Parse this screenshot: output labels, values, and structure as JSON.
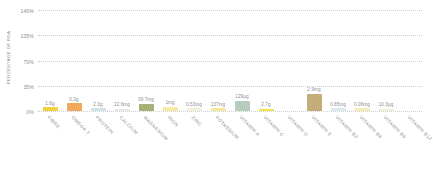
{
  "chart_data": {
    "type": "bar",
    "title": "",
    "xlabel": "",
    "ylabel": "PERCENTAGE OF RDA",
    "ylim": [
      0,
      140
    ],
    "grid": true,
    "legend": "none",
    "ytick_labels": [
      "140%",
      "105%",
      "70%",
      "35%",
      "0%"
    ],
    "ytick_values": [
      140,
      105,
      70,
      35,
      0
    ],
    "categories": [
      "FIBRE",
      "OMEGA 3",
      "PROTEIN",
      "CALCIUM",
      "MAGNESIUM",
      "IRON",
      "ZINC",
      "POTASSIUM",
      "VITAMIN A",
      "VITAMIN C",
      "VITAMIN D",
      "VITAMIN E",
      "VITAMIN B3",
      "VITAMIN B6",
      "VITAMIN B9",
      "VITAMIN B12"
    ],
    "values": [
      5,
      11,
      4,
      3,
      10,
      6,
      4,
      4,
      14,
      3,
      0,
      24,
      4,
      4,
      3,
      0
    ],
    "data_labels": [
      "1.6g",
      "0.3g",
      "2.3g",
      "22.6mg",
      "39.7mg",
      "1mg",
      "0.53mg",
      "137mg",
      "129µg",
      "2.7g",
      "",
      "2.9mg",
      "0.85mg",
      "0.06mg",
      "10.3µg",
      ""
    ],
    "bar_colors": [
      "#f2d23c",
      "#f0a85a",
      "#cfe5ea",
      "#e8e8e4",
      "#a9b077",
      "#f7e9a6",
      "#f3efd9",
      "#f5e79b",
      "#b8ccbe",
      "#f5e04a",
      "#ffffff",
      "#c6ac78",
      "#dce9ef",
      "#f6ecb8",
      "#f1edd6",
      "#ffffff"
    ],
    "gridline_color": "#cfcfcf",
    "text_color": "#8d8d8d",
    "background": "#ffffff"
  }
}
